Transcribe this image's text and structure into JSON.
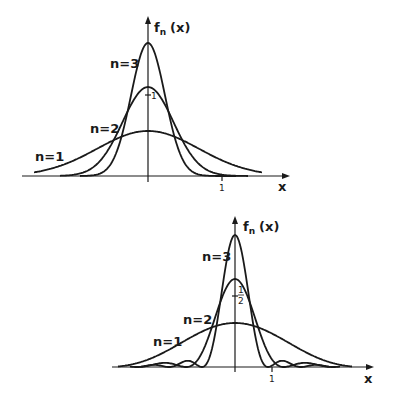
{
  "figures": [
    {
      "id": "top",
      "kind": "gaussian",
      "y_axis_label": "f",
      "y_axis_sub": "n",
      "y_axis_arg": "(x)",
      "x_axis_label": "x",
      "x_tick_label": "1",
      "y_tick_label": "1",
      "curve_labels": [
        "n=1",
        "n=2",
        "n=3"
      ]
    },
    {
      "id": "bottom",
      "kind": "fejer",
      "y_axis_label": "f",
      "y_axis_sub": "n",
      "y_axis_arg": "(x)",
      "x_axis_label": "x",
      "x_tick_label": "1",
      "y_tick_num": "1",
      "y_tick_den": "2",
      "curve_labels": [
        "n=1",
        "n=2",
        "n=3"
      ]
    }
  ],
  "chart_data": [
    {
      "type": "line",
      "title": "",
      "xlabel": "x",
      "ylabel": "f_n (x)",
      "x_ticks": [
        "1"
      ],
      "y_ticks": [
        "1"
      ],
      "series": [
        {
          "name": "n=1",
          "peak": 0.55,
          "shape": "gaussian",
          "width": 0.8
        },
        {
          "name": "n=2",
          "peak": 1.1,
          "shape": "gaussian",
          "width": 0.4
        },
        {
          "name": "n=3",
          "peak": 1.65,
          "shape": "gaussian",
          "width": 0.27
        }
      ],
      "grid": false,
      "legend": "inline labels"
    },
    {
      "type": "line",
      "title": "",
      "xlabel": "x",
      "ylabel": "f_n (x)",
      "x_ticks": [
        "1"
      ],
      "y_ticks": [
        "1/2"
      ],
      "series": [
        {
          "name": "n=1",
          "peak": 0.51,
          "shape": "oscillating (sinc^2-like)",
          "first_zero": 3.6
        },
        {
          "name": "n=2",
          "peak": 1.02,
          "shape": "oscillating (sinc^2-like)",
          "first_zero": 1.3
        },
        {
          "name": "n=3",
          "peak": 1.53,
          "shape": "oscillating (sinc^2-like)",
          "first_zero": 0.9
        }
      ],
      "grid": false,
      "legend": "inline labels"
    }
  ]
}
